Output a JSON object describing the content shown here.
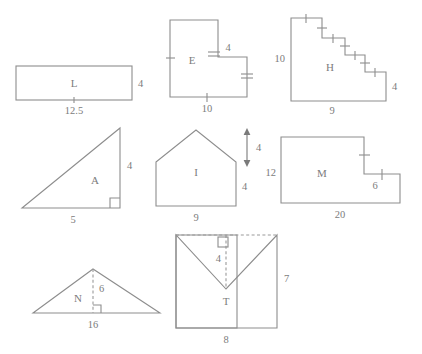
{
  "page": {
    "background_color": "#ffffff",
    "line_color": "#8d8d8d",
    "text_color": "#7c7c7c"
  },
  "shapes": [
    {
      "id": "L",
      "name": "L",
      "type": "rectangle",
      "dimensions": [
        {
          "value": "12.5",
          "position": "bottom"
        },
        {
          "value": "4",
          "position": "right"
        }
      ]
    },
    {
      "id": "E",
      "name": "E",
      "type": "L-shape-polygon",
      "dimensions": [
        {
          "value": "4",
          "position": "inner-top"
        },
        {
          "value": "10",
          "position": "bottom"
        }
      ]
    },
    {
      "id": "H",
      "name": "H",
      "type": "staircase-polygon",
      "dimensions": [
        {
          "value": "10",
          "position": "left"
        },
        {
          "value": "4",
          "position": "right"
        },
        {
          "value": "9",
          "position": "bottom"
        }
      ]
    },
    {
      "id": "A",
      "name": "A",
      "type": "right-triangle",
      "dimensions": [
        {
          "value": "4",
          "position": "right"
        },
        {
          "value": "5",
          "position": "bottom"
        }
      ]
    },
    {
      "id": "I",
      "name": "I",
      "type": "pentagon-house",
      "dimensions": [
        {
          "value": "4",
          "position": "roof-height-arrow"
        },
        {
          "value": "4",
          "position": "right"
        },
        {
          "value": "9",
          "position": "bottom"
        }
      ]
    },
    {
      "id": "M",
      "name": "M",
      "type": "notched-rectangle",
      "dimensions": [
        {
          "value": "12",
          "position": "left"
        },
        {
          "value": "6",
          "position": "notch"
        },
        {
          "value": "20",
          "position": "bottom"
        }
      ]
    },
    {
      "id": "N",
      "name": "N",
      "type": "triangle-with-height",
      "dimensions": [
        {
          "value": "6",
          "position": "height"
        },
        {
          "value": "16",
          "position": "bottom"
        }
      ]
    },
    {
      "id": "T",
      "name": "T",
      "type": "envelope-polygon",
      "dimensions": [
        {
          "value": "4",
          "position": "notch-depth"
        },
        {
          "value": "7",
          "position": "right"
        },
        {
          "value": "8",
          "position": "bottom"
        }
      ]
    }
  ]
}
